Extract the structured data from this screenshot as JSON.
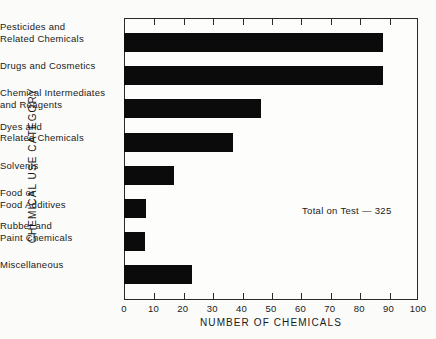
{
  "chart_data": {
    "type": "bar",
    "orientation": "horizontal",
    "title": "",
    "xlabel": "NUMBER OF CHEMICALS",
    "ylabel": "CHEMICAL USE CATEGORY",
    "xlim": [
      0,
      100
    ],
    "xticks": [
      0,
      10,
      20,
      30,
      40,
      50,
      60,
      70,
      80,
      90,
      100
    ],
    "xtick_labels": [
      "0",
      "10",
      "20",
      "30",
      "40",
      "50",
      "60",
      "70",
      "80",
      "90",
      "100"
    ],
    "grid": false,
    "legend": false,
    "bar_color": "#0b0b0b",
    "categories": [
      "Pesticides  and\nRelated  Chemicals",
      "Drugs  and  Cosmetics",
      "Chemical  Intermediates\nand  Reagents",
      "Dyes  and\nRelated  Chemicals",
      "Solvents",
      "Food  or\nFood  Additives",
      "Rubber  and\nPaint  Chemicals",
      "Miscellaneous"
    ],
    "values": [
      88,
      88,
      46.5,
      37,
      17,
      7.5,
      7,
      23
    ],
    "annotations": [
      {
        "text": "Total  on  Test  —  325",
        "x": 60,
        "y": 5.5
      }
    ]
  }
}
